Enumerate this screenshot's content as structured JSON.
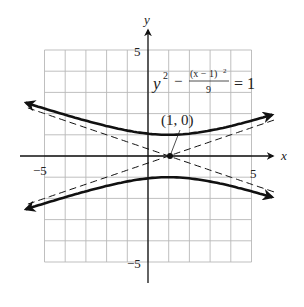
{
  "chart_data": {
    "type": "line",
    "title": "",
    "equation": {
      "lhs_base": "y",
      "lhs_exp": "2",
      "minus": "−",
      "frac_num": "(x − 1)",
      "frac_num_exp": "2",
      "frac_den": "9",
      "rhs": "= 1"
    },
    "xlabel": "x",
    "ylabel": "y",
    "xlim": [
      -5,
      5
    ],
    "ylim": [
      -5,
      5
    ],
    "grid": true,
    "tick_labels": {
      "x_neg": "−5",
      "x_pos": "5",
      "y_pos": "5",
      "y_neg": "−5"
    },
    "center": {
      "x": 1,
      "y": 0,
      "label": "(1, 0)"
    },
    "series": [
      {
        "name": "upper branch",
        "style": "solid",
        "function": "y = sqrt(1 + (x-1)^2/9)",
        "x_range": [
          -5.9,
          6.0
        ]
      },
      {
        "name": "lower branch",
        "style": "solid",
        "function": "y = -sqrt(1 + (x-1)^2/9)",
        "x_range": [
          -5.9,
          6.0
        ]
      },
      {
        "name": "asymptote 1",
        "style": "dashed",
        "function": "y = (x-1)/3",
        "x_range": [
          -5.8,
          6.1
        ]
      },
      {
        "name": "asymptote 2",
        "style": "dashed",
        "function": "y = -(x-1)/3",
        "x_range": [
          -5.8,
          6.1
        ]
      }
    ]
  },
  "colors": {
    "grid": "#b8b8b8",
    "ink": "#111111"
  }
}
